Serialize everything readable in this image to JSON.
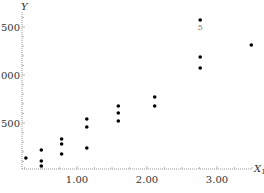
{
  "chart_data": {
    "type": "scatter",
    "title": "",
    "xlabel": "X1",
    "ylabel": "Y",
    "xlim": [
      0.1,
      3.6
    ],
    "ylim": [
      0,
      1650
    ],
    "x_ticks": [
      {
        "value": 1.0,
        "label": "1.00"
      },
      {
        "value": 2.0,
        "label": "2.00"
      },
      {
        "value": 3.0,
        "label": "3.00"
      }
    ],
    "y_ticks": [
      {
        "value": 500,
        "label": "500"
      },
      {
        "value": 1000,
        "label": "1000"
      },
      {
        "value": 1500,
        "label": "1500"
      }
    ],
    "grid": false,
    "legend": null,
    "points": [
      {
        "x": 0.27,
        "y": 135
      },
      {
        "x": 0.49,
        "y": 219
      },
      {
        "x": 0.49,
        "y": 104
      },
      {
        "x": 0.49,
        "y": 52
      },
      {
        "x": 0.78,
        "y": 333
      },
      {
        "x": 0.78,
        "y": 281
      },
      {
        "x": 0.78,
        "y": 177
      },
      {
        "x": 1.14,
        "y": 542
      },
      {
        "x": 1.14,
        "y": 458
      },
      {
        "x": 1.14,
        "y": 240
      },
      {
        "x": 1.59,
        "y": 677
      },
      {
        "x": 1.59,
        "y": 604
      },
      {
        "x": 1.59,
        "y": 521
      },
      {
        "x": 2.11,
        "y": 771
      },
      {
        "x": 2.11,
        "y": 677
      },
      {
        "x": 2.76,
        "y": 1573,
        "label": "5"
      },
      {
        "x": 2.76,
        "y": 1188
      },
      {
        "x": 2.76,
        "y": 1073
      },
      {
        "x": 3.49,
        "y": 1313
      }
    ]
  },
  "layout": {
    "x_origin_px": 7,
    "x_px_per_unit": 70,
    "y_origin_px": 171,
    "y_px_per_unit": 0.096,
    "axis_y_px": 169,
    "axis_x_px": 22,
    "axis_left_px": 22,
    "axis_right_px": 252,
    "axis_top_px": 12
  }
}
